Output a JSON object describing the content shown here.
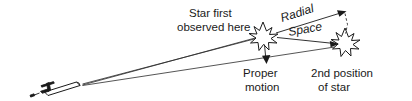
{
  "diagram": {
    "background_color": "#ffffff",
    "ink_color": "#1a1a1a",
    "labels": {
      "star_first_observed_line1": "Star first",
      "star_first_observed_line2": "observed here",
      "radial": "Radial",
      "space": "Space",
      "proper_motion_line1": "Proper",
      "proper_motion_line2": "motion",
      "second_position_line1": "2nd position",
      "second_position_line2": "of star"
    },
    "elements": {
      "telescope": "telescope-observer",
      "star_one": "star-first-position",
      "star_two": "star-second-position",
      "sight_line_upper": "line-of-sight-to-first-position",
      "sight_line_lower": "line-of-sight-to-second-position",
      "radial_vector": "radial-velocity-arrow",
      "space_vector": "space-velocity-arrow",
      "proper_motion_vector": "proper-motion-arrow",
      "projection_line": "radial-projection-dashed-line"
    }
  }
}
